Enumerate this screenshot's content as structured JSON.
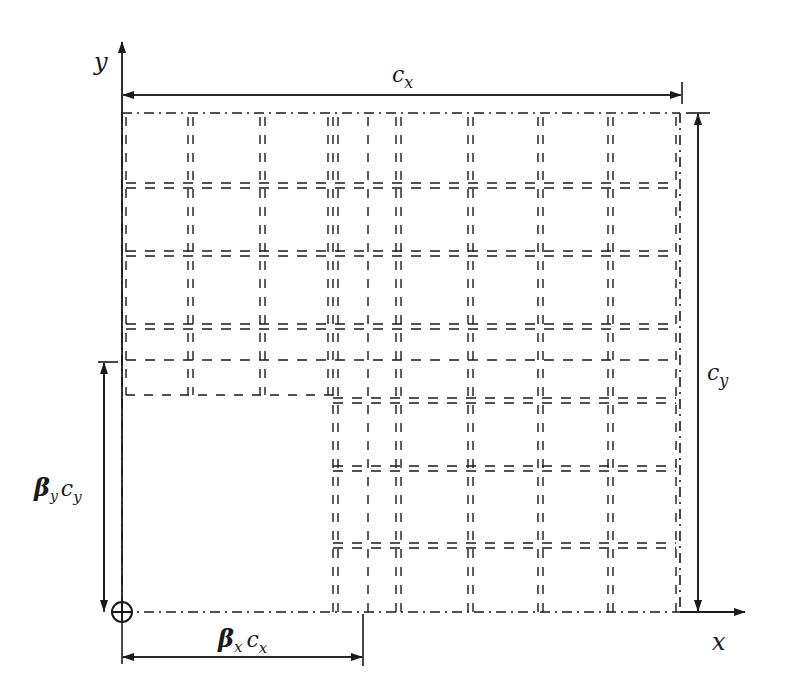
{
  "diagram": {
    "axes": {
      "x_label": "x",
      "y_label": "y",
      "origin_symbol": "circle-cross"
    },
    "dimensions": {
      "width_label": "c",
      "width_sub": "x",
      "height_label": "c",
      "height_sub": "y",
      "offset_x_beta": "β",
      "offset_x_beta_sub": "x",
      "offset_x_c": "c",
      "offset_x_c_sub": "x",
      "offset_y_beta": "β",
      "offset_y_beta_sub": "y",
      "offset_y_c": "c",
      "offset_y_c_sub": "y"
    },
    "regions": [
      {
        "name": "upper-left-panel",
        "x0": 122,
        "y0": 113,
        "x1": 333,
        "y1": 395
      },
      {
        "name": "right-panel",
        "x0": 333,
        "y0": 113,
        "x1": 680,
        "y1": 612
      }
    ],
    "grid": {
      "left_vertical_x": [
        190,
        262
      ],
      "right_vertical_x": [
        368,
        398,
        470,
        540,
        610
      ],
      "upper_horizontal_y": [
        185,
        253,
        326,
        360
      ],
      "lower_horizontal_y": [
        400,
        468,
        545
      ]
    },
    "colors": {
      "stroke": "#1a1a1a",
      "background": "#ffffff"
    }
  }
}
